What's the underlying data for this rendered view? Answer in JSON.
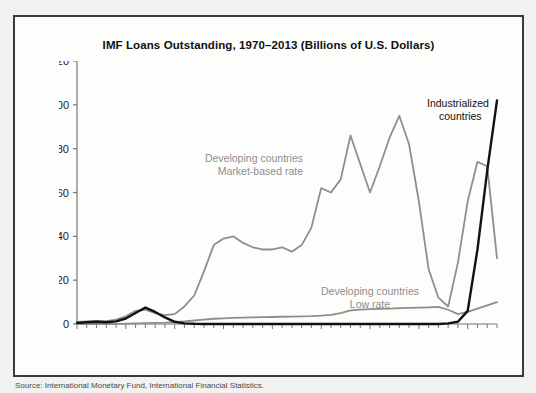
{
  "figure": {
    "title": "IMF Loans Outstanding, 1970–2013 (Billions of U.S. Dollars)",
    "source_caption": "Source: International Monetary Fund, International Financial Statistics.",
    "frame_color": "#3a3a3a",
    "background_color": "#f2f2f0",
    "panel_color": "#fdfdfc"
  },
  "annotations": {
    "market_line1": "Developing countries",
    "market_line2": "Market-based rate",
    "low_line1": "Developing countries",
    "low_line2": "Low rate",
    "industrial_line1": "Industrialized",
    "industrial_line2": "countries"
  },
  "chart_data": {
    "type": "line",
    "title": "IMF Loans Outstanding, 1970–2013 (Billions of U.S. Dollars)",
    "xlabel": "",
    "ylabel": "",
    "xlim": [
      1970,
      2013
    ],
    "ylim": [
      0,
      120
    ],
    "ytick_values": [
      0,
      20,
      40,
      60,
      80,
      100,
      120
    ],
    "ytick_labels": [
      "0",
      "20",
      "40",
      "60",
      "80",
      "100",
      "120"
    ],
    "xtick_values": [
      1970,
      1975,
      1980,
      1985,
      1990,
      1995,
      2000,
      2005,
      2010
    ],
    "xtick_labels": [
      "1970",
      "1975",
      "1980",
      "1985",
      "1990",
      "1995",
      "2000",
      "2005",
      "2010"
    ],
    "xtick_rotation": 90,
    "minor_xticks_every": 1,
    "grid": false,
    "legend": "inline-annotations",
    "x": [
      1970,
      1971,
      1972,
      1973,
      1974,
      1975,
      1976,
      1977,
      1978,
      1979,
      1980,
      1981,
      1982,
      1983,
      1984,
      1985,
      1986,
      1987,
      1988,
      1989,
      1990,
      1991,
      1992,
      1993,
      1994,
      1995,
      1996,
      1997,
      1998,
      1999,
      2000,
      2001,
      2002,
      2003,
      2004,
      2005,
      2006,
      2007,
      2008,
      2009,
      2010,
      2011,
      2012,
      2013
    ],
    "series": [
      {
        "name": "Developing countries Market-based rate",
        "color": "#8e8e8e",
        "values": [
          1.0,
          1.2,
          1.4,
          1.3,
          2.0,
          3.5,
          6.0,
          6.5,
          5.0,
          4.0,
          4.5,
          8.0,
          13.0,
          24.0,
          36.0,
          39.0,
          40.0,
          37.0,
          35.0,
          34.0,
          34.0,
          35.0,
          33.0,
          36.0,
          44.0,
          62.0,
          60.0,
          66.0,
          86.0,
          73.0,
          60.0,
          72.0,
          85.0,
          95.0,
          82.0,
          56.0,
          25.0,
          12.0,
          8.0,
          28.0,
          56.0,
          74.0,
          72.0,
          30.0
        ]
      },
      {
        "name": "Developing countries Low rate",
        "color": "#8e8e8e",
        "values": [
          0.0,
          0.0,
          0.0,
          0.0,
          0.1,
          0.2,
          0.3,
          0.4,
          0.5,
          0.6,
          0.8,
          1.2,
          1.6,
          2.0,
          2.4,
          2.6,
          2.8,
          2.9,
          3.0,
          3.1,
          3.2,
          3.3,
          3.4,
          3.5,
          3.6,
          3.8,
          4.2,
          5.0,
          6.2,
          6.6,
          6.8,
          6.9,
          7.0,
          7.2,
          7.4,
          7.5,
          7.6,
          7.8,
          6.5,
          4.5,
          5.5,
          7.0,
          8.5,
          10.0
        ]
      },
      {
        "name": "Industrialized countries",
        "color": "#111111",
        "values": [
          0.5,
          0.8,
          1.0,
          0.8,
          1.2,
          2.5,
          5.0,
          7.5,
          5.5,
          3.0,
          1.0,
          0.3,
          0.1,
          0.0,
          0.0,
          0.0,
          0.0,
          0.0,
          0.0,
          0.0,
          0.0,
          0.0,
          0.0,
          0.0,
          0.0,
          0.0,
          0.0,
          0.0,
          0.0,
          0.0,
          0.0,
          0.0,
          0.0,
          0.0,
          0.0,
          0.0,
          0.0,
          0.0,
          0.3,
          1.0,
          6.0,
          34.0,
          70.0,
          102.0
        ]
      }
    ]
  }
}
